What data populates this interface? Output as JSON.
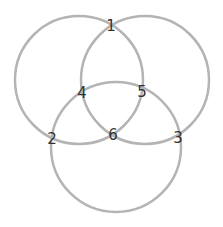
{
  "diagram": {
    "stroke_color": "#b4b4b4",
    "label_color": "#333333",
    "circles": [
      {
        "name": "left",
        "cx": 79,
        "cy": 80,
        "r": 64
      },
      {
        "name": "right",
        "cx": 145,
        "cy": 80,
        "r": 64
      },
      {
        "name": "bottom",
        "cx": 116,
        "cy": 147,
        "r": 65
      }
    ],
    "labels": [
      {
        "text": "1",
        "x": 111,
        "y": 31
      },
      {
        "text": "2",
        "x": 52,
        "y": 144
      },
      {
        "text": "3",
        "x": 178,
        "y": 143
      },
      {
        "text": "4",
        "x": 82,
        "y": 98
      },
      {
        "text": "5",
        "x": 142,
        "y": 97
      },
      {
        "text": "6",
        "x": 113,
        "y": 140
      }
    ]
  }
}
